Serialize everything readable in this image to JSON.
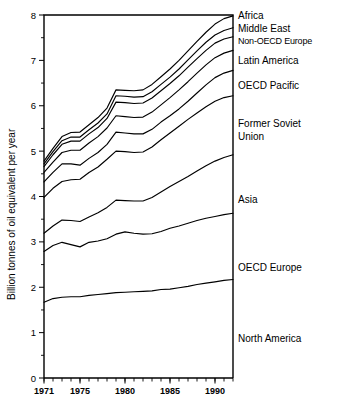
{
  "chart_data": {
    "type": "line",
    "title": "",
    "subtitle": "",
    "xlabel": "",
    "ylabel": "Billion tonnes of oil equivalent per year",
    "xlim": [
      1971,
      1992
    ],
    "ylim": [
      0,
      8
    ],
    "grid": false,
    "legend_position": "right-inline",
    "note": "Cumulative (stacked) curves: each line is the running total of regional energy consumption added from the bottom up.",
    "x": [
      1971,
      1972,
      1973,
      1974,
      1975,
      1976,
      1977,
      1978,
      1979,
      1980,
      1981,
      1982,
      1983,
      1984,
      1985,
      1986,
      1987,
      1988,
      1989,
      1990,
      1991,
      1992
    ],
    "xticks_major": [
      1971,
      1975,
      1980,
      1985,
      1990
    ],
    "xtick_labels": [
      "1971",
      "1975",
      "1980",
      "1985",
      "1990"
    ],
    "yticks_major": [
      0,
      1,
      2,
      3,
      4,
      5,
      6,
      7,
      8
    ],
    "ytick_labels": [
      "0",
      "1",
      "2",
      "3",
      "4",
      "5",
      "6",
      "7",
      "8"
    ],
    "yticks_minor": [
      0.5,
      1.5,
      2.5,
      3.5,
      4.5,
      5.5,
      6.5,
      7.5
    ],
    "series": [
      {
        "name": "North America",
        "label": "North America",
        "values": [
          1.67,
          1.75,
          1.78,
          1.79,
          1.79,
          1.82,
          1.84,
          1.86,
          1.88,
          1.89,
          1.9,
          1.91,
          1.92,
          1.95,
          1.96,
          1.99,
          2.02,
          2.06,
          2.09,
          2.12,
          2.15,
          2.17
        ]
      },
      {
        "name": "OECD Europe",
        "label": "OECD Europe",
        "values": [
          2.79,
          2.92,
          2.99,
          2.94,
          2.89,
          2.99,
          3.02,
          3.07,
          3.17,
          3.22,
          3.19,
          3.17,
          3.18,
          3.23,
          3.3,
          3.35,
          3.41,
          3.47,
          3.52,
          3.56,
          3.6,
          3.63
        ]
      },
      {
        "name": "Asia",
        "label": "Asia",
        "values": [
          3.19,
          3.35,
          3.48,
          3.47,
          3.45,
          3.55,
          3.64,
          3.76,
          3.92,
          3.91,
          3.9,
          3.9,
          3.98,
          4.1,
          4.22,
          4.33,
          4.44,
          4.56,
          4.68,
          4.78,
          4.86,
          4.92
        ]
      },
      {
        "name": "Former Soviet Union",
        "label": "Former Soviet Union",
        "values": [
          3.98,
          4.18,
          4.33,
          4.37,
          4.38,
          4.53,
          4.65,
          4.82,
          5.0,
          4.99,
          4.97,
          4.98,
          5.09,
          5.25,
          5.4,
          5.55,
          5.7,
          5.84,
          5.98,
          6.1,
          6.18,
          6.22
        ]
      },
      {
        "name": "OECD Pacific",
        "label": "OECD Pacific",
        "values": [
          4.32,
          4.53,
          4.72,
          4.72,
          4.69,
          4.84,
          4.97,
          5.15,
          5.42,
          5.4,
          5.38,
          5.38,
          5.48,
          5.64,
          5.78,
          5.93,
          6.1,
          6.28,
          6.46,
          6.62,
          6.72,
          6.78
        ]
      },
      {
        "name": "Latin America",
        "label": "Latin America",
        "values": [
          4.53,
          4.76,
          4.97,
          5.02,
          5.02,
          5.18,
          5.32,
          5.51,
          5.78,
          5.76,
          5.74,
          5.75,
          5.86,
          6.02,
          6.18,
          6.35,
          6.53,
          6.72,
          6.9,
          7.06,
          7.16,
          7.22
        ]
      },
      {
        "name": "Non-OECD Europe",
        "label": "Non-OECD Europe",
        "values": [
          4.66,
          4.92,
          5.15,
          5.22,
          5.22,
          5.38,
          5.52,
          5.72,
          6.08,
          6.07,
          6.05,
          6.06,
          6.17,
          6.33,
          6.49,
          6.66,
          6.85,
          7.04,
          7.22,
          7.38,
          7.47,
          7.52
        ]
      },
      {
        "name": "Middle East",
        "label": "Middle East",
        "values": [
          4.72,
          4.99,
          5.23,
          5.31,
          5.31,
          5.47,
          5.62,
          5.82,
          6.22,
          6.21,
          6.19,
          6.2,
          6.31,
          6.47,
          6.63,
          6.81,
          7.01,
          7.21,
          7.4,
          7.56,
          7.66,
          7.72
        ]
      },
      {
        "name": "Africa",
        "label": "Africa",
        "values": [
          4.78,
          5.06,
          5.32,
          5.41,
          5.42,
          5.58,
          5.74,
          5.95,
          6.35,
          6.34,
          6.33,
          6.35,
          6.47,
          6.64,
          6.81,
          7.0,
          7.21,
          7.42,
          7.62,
          7.8,
          7.92,
          7.98
        ]
      }
    ]
  },
  "legend": {
    "items": [
      {
        "label": "Africa",
        "y": 10,
        "condensed": false
      },
      {
        "label": "Middle East",
        "y": 23,
        "condensed": false
      },
      {
        "label": "Non-OECD Europe",
        "y": 36,
        "condensed": true
      },
      {
        "label": "Latin America",
        "y": 55,
        "condensed": false
      },
      {
        "label": "OECD Pacific",
        "y": 80,
        "condensed": false
      },
      {
        "label": "Former Soviet",
        "y": 118,
        "condensed": false
      },
      {
        "label": "Union",
        "y": 131,
        "condensed": false
      },
      {
        "label": "Asia",
        "y": 194,
        "condensed": false
      },
      {
        "label": "OECD Europe",
        "y": 262,
        "condensed": false
      },
      {
        "label": "North America",
        "y": 333,
        "condensed": false
      }
    ]
  }
}
